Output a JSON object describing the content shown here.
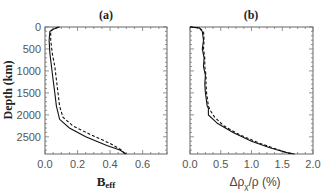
{
  "chart_data": [
    {
      "type": "line",
      "title": "(a)",
      "xlabel": "B_eff",
      "xlabel_main": "B",
      "xlabel_sub": "eff",
      "ylabel": "Depth (km)",
      "xlim": [
        0.0,
        0.75
      ],
      "ylim": [
        2891,
        0
      ],
      "xticks": [
        "0.0",
        "0.2",
        "0.4",
        "0.6"
      ],
      "yticks": [
        "0",
        "500",
        "1000",
        "1500",
        "2000",
        "2500"
      ],
      "grid": false,
      "series": [
        {
          "name": "solid",
          "style": "solid",
          "points": [
            [
              0.09,
              0
            ],
            [
              0.05,
              50
            ],
            [
              0.03,
              100
            ],
            [
              0.025,
              300
            ],
            [
              0.03,
              600
            ],
            [
              0.04,
              900
            ],
            [
              0.05,
              1200
            ],
            [
              0.06,
              1500
            ],
            [
              0.07,
              1800
            ],
            [
              0.09,
              2100
            ],
            [
              0.15,
              2300
            ],
            [
              0.25,
              2500
            ],
            [
              0.38,
              2700
            ],
            [
              0.46,
              2800
            ],
            [
              0.5,
              2891
            ]
          ]
        },
        {
          "name": "dashed",
          "style": "dashed",
          "points": [
            [
              0.08,
              0
            ],
            [
              0.05,
              50
            ],
            [
              0.035,
              100
            ],
            [
              0.035,
              300
            ],
            [
              0.045,
              600
            ],
            [
              0.06,
              900
            ],
            [
              0.07,
              1200
            ],
            [
              0.08,
              1500
            ],
            [
              0.09,
              1800
            ],
            [
              0.11,
              2050
            ],
            [
              0.17,
              2250
            ],
            [
              0.28,
              2450
            ],
            [
              0.4,
              2650
            ],
            [
              0.47,
              2800
            ],
            [
              0.49,
              2891
            ]
          ]
        }
      ]
    },
    {
      "type": "line",
      "title": "(b)",
      "xlabel": "Δρχ/ρ (%)",
      "xlabel_pre": "Δρ",
      "xlabel_sub": "χ",
      "xlabel_post": "/ρ (%)",
      "ylabel": "Depth (km)",
      "xlim": [
        0.0,
        2.0
      ],
      "ylim": [
        2891,
        0
      ],
      "xticks": [
        "0.0",
        "0.5",
        "1.0",
        "1.5",
        "2.0"
      ],
      "yticks": [],
      "grid": false,
      "series": [
        {
          "name": "solid",
          "style": "solid",
          "points": [
            [
              0.0,
              0
            ],
            [
              0.15,
              20
            ],
            [
              0.2,
              100
            ],
            [
              0.22,
              300
            ],
            [
              0.2,
              500
            ],
            [
              0.23,
              700
            ],
            [
              0.22,
              900
            ],
            [
              0.25,
              1100
            ],
            [
              0.24,
              1300
            ],
            [
              0.25,
              1500
            ],
            [
              0.27,
              1700
            ],
            [
              0.28,
              1800
            ],
            [
              0.3,
              1850
            ],
            [
              0.3,
              2000
            ],
            [
              0.45,
              2200
            ],
            [
              0.7,
              2400
            ],
            [
              1.0,
              2600
            ],
            [
              1.3,
              2750
            ],
            [
              1.55,
              2850
            ],
            [
              1.7,
              2891
            ]
          ]
        },
        {
          "name": "dashed",
          "style": "dashed",
          "points": [
            [
              0.0,
              0
            ],
            [
              0.15,
              20
            ],
            [
              0.22,
              100
            ],
            [
              0.23,
              300
            ],
            [
              0.22,
              500
            ],
            [
              0.24,
              700
            ],
            [
              0.24,
              900
            ],
            [
              0.26,
              1100
            ],
            [
              0.26,
              1300
            ],
            [
              0.27,
              1500
            ],
            [
              0.29,
              1700
            ],
            [
              0.3,
              1800
            ],
            [
              0.33,
              1900
            ],
            [
              0.4,
              2050
            ],
            [
              0.55,
              2250
            ],
            [
              0.8,
              2450
            ],
            [
              1.1,
              2630
            ],
            [
              1.4,
              2780
            ],
            [
              1.6,
              2870
            ],
            [
              1.65,
              2891
            ]
          ]
        }
      ]
    }
  ]
}
